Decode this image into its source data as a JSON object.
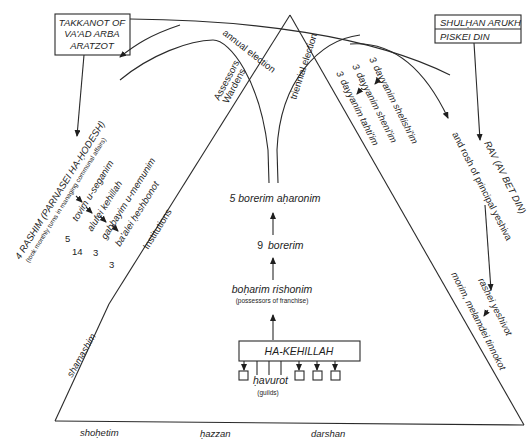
{
  "diagram": {
    "sources_left": {
      "lines": [
        "TAKKANOT OF",
        "VA'AD ARBA",
        "ARATZOT"
      ]
    },
    "sources_right": {
      "line1": "SHULḤAN ARUKH",
      "line2": "PISKEI DIN"
    },
    "edge_labels": {
      "annual_election": "annual election",
      "triennial_election": "triennial election",
      "assessors": "Assessors",
      "wardens": "Wardens"
    },
    "leadership": {
      "rashim": "4 RASHIM (PARNASEI HA-ḤODESH)",
      "rashim_note": "(took monthly turns in managing communal affairs)",
      "ranks": [
        {
          "count": "5",
          "label": "tovim u-seganim"
        },
        {
          "count": "14",
          "label": "alufei kehillah"
        },
        {
          "count": "3",
          "label": "gabbayim u-memunim"
        },
        {
          "count": "3",
          "label": "ba'alei ḥeshbonot"
        }
      ],
      "institutions": "Institutions"
    },
    "dayyanim": [
      {
        "count": "3",
        "label": "dayyanim shelishi'im"
      },
      {
        "count": "3",
        "label": "dayyanim sheni'im"
      },
      {
        "count": "3",
        "label": "dayyanim tahti'im"
      }
    ],
    "rav": {
      "line1": "RAV (AV BET DIN)",
      "line2": "and rosh of principal yeshiva"
    },
    "education": {
      "rashei": "rashei yeshivot",
      "morim": "morim, melamdei tinnokot"
    },
    "electors": {
      "borerim_aharonim": "5 borerim aḥaronim",
      "borerim_count": "9",
      "borerim": "borerim",
      "boharim": "boḥarim rishonim",
      "boharim_note": "(possessors of franchise)"
    },
    "base": {
      "kehillah": "HA-KEHILLAH",
      "havurot": "ḥavurot",
      "havurot_note": "(guilds)",
      "shamashim": "shamashim",
      "shohetim": "shoḥetim",
      "hazzan": "ḥazzan",
      "darshan": "darshan"
    }
  }
}
